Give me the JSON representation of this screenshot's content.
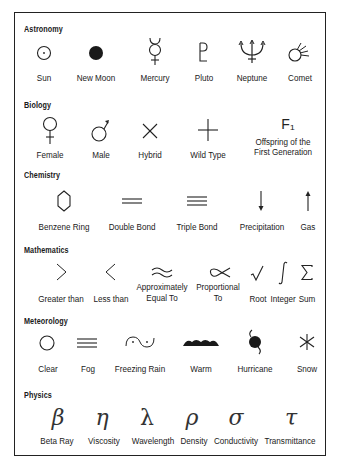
{
  "sections": [
    {
      "title": "Astronomy",
      "items": [
        {
          "icon": "sun-icon",
          "label": "Sun"
        },
        {
          "icon": "new-moon-icon",
          "label": "New Moon"
        },
        {
          "icon": "mercury-icon",
          "label": "Mercury"
        },
        {
          "icon": "pluto-icon",
          "label": "Pluto"
        },
        {
          "icon": "neptune-icon",
          "label": "Neptune"
        },
        {
          "icon": "comet-icon",
          "label": "Comet"
        }
      ]
    },
    {
      "title": "Biology",
      "items": [
        {
          "icon": "female-icon",
          "label": "Female"
        },
        {
          "icon": "male-icon",
          "label": "Male"
        },
        {
          "icon": "hybrid-icon",
          "label": "Hybrid"
        },
        {
          "icon": "wild-type-icon",
          "label": "Wild Type"
        },
        {
          "icon": "f1-icon",
          "symbol": "F₁",
          "label_line1": "Offspring of the",
          "label_line2": "First Generation"
        }
      ]
    },
    {
      "title": "Chemistry",
      "items": [
        {
          "icon": "benzene-ring-icon",
          "label": "Benzene Ring"
        },
        {
          "icon": "double-bond-icon",
          "label": "Double Bond"
        },
        {
          "icon": "triple-bond-icon",
          "label": "Triple Bond"
        },
        {
          "icon": "precipitation-icon",
          "label": "Precipitation"
        },
        {
          "icon": "gas-icon",
          "label": "Gas"
        }
      ]
    },
    {
      "title": "Mathematics",
      "items": [
        {
          "icon": "greater-than-icon",
          "symbol": ">",
          "label": "Greater than"
        },
        {
          "icon": "less-than-icon",
          "symbol": "<",
          "label": "Less than"
        },
        {
          "icon": "approximately-equal-icon",
          "symbol": "≈",
          "label_line1": "Approximately",
          "label_line2": "Equal To"
        },
        {
          "icon": "proportional-to-icon",
          "symbol": "∝",
          "label_line1": "Proportional",
          "label_line2": "To"
        },
        {
          "icon": "root-icon",
          "symbol": "√",
          "label": "Root"
        },
        {
          "icon": "integer-icon",
          "symbol": "∫",
          "label": "Integer"
        },
        {
          "icon": "sum-icon",
          "symbol": "Σ",
          "label": "Sum"
        }
      ]
    },
    {
      "title": "Meteorology",
      "items": [
        {
          "icon": "clear-icon",
          "label": "Clear"
        },
        {
          "icon": "fog-icon",
          "label": "Fog"
        },
        {
          "icon": "freezing-rain-icon",
          "label": "Freezing Rain"
        },
        {
          "icon": "warm-front-icon",
          "label": "Warm"
        },
        {
          "icon": "hurricane-icon",
          "label": "Hurricane"
        },
        {
          "icon": "snow-icon",
          "label": "Snow"
        }
      ]
    },
    {
      "title": "Physics",
      "items": [
        {
          "icon": "beta-ray-icon",
          "symbol": "β",
          "label": "Beta Ray"
        },
        {
          "icon": "viscosity-icon",
          "symbol": "η",
          "label": "Viscosity"
        },
        {
          "icon": "wavelength-icon",
          "symbol": "λ",
          "label": "Wavelength"
        },
        {
          "icon": "density-icon",
          "symbol": "ρ",
          "label": "Density"
        },
        {
          "icon": "conductivity-icon",
          "symbol": "σ",
          "label": "Conductivity"
        },
        {
          "icon": "transmittance-icon",
          "symbol": "τ",
          "label": "Transmittance"
        }
      ]
    }
  ]
}
